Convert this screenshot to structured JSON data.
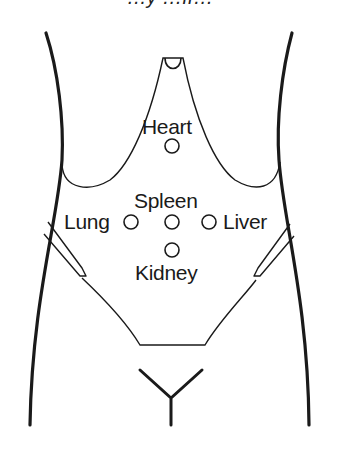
{
  "figure": {
    "title_clipped": "…y …ff…",
    "labels": {
      "heart": "Heart",
      "spleen": "Spleen",
      "lung": "Lung",
      "liver": "Liver",
      "kidney": "Kidney"
    },
    "points": [
      {
        "name": "Heart",
        "cx": 172,
        "cy": 146
      },
      {
        "name": "Lung",
        "cx": 131,
        "cy": 222
      },
      {
        "name": "Spleen",
        "cx": 172,
        "cy": 222
      },
      {
        "name": "Liver",
        "cx": 209,
        "cy": 222
      },
      {
        "name": "Kidney",
        "cx": 172,
        "cy": 250
      }
    ],
    "colors": {
      "stroke": "#1a1a1a",
      "background": "#ffffff"
    }
  }
}
